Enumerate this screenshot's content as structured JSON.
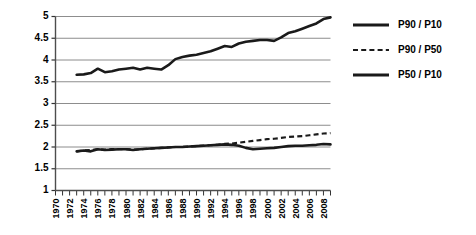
{
  "chart_data": {
    "type": "line",
    "title": "",
    "xlabel": "",
    "ylabel": "",
    "xlim": [
      1970,
      2009
    ],
    "ylim": [
      1,
      5
    ],
    "ygrid": true,
    "xgrid": false,
    "ytick_values": [
      1,
      1.5,
      2,
      2.5,
      3,
      3.5,
      4,
      4.5,
      5
    ],
    "ytick_labels": [
      "1",
      "1.5",
      "2",
      "2.5",
      "3",
      "3.5",
      "4",
      "4.5",
      "5"
    ],
    "xtick_labels": [
      "1970",
      "1972",
      "1974",
      "1976",
      "1978",
      "1980",
      "1982",
      "1984",
      "1986",
      "1988",
      "1990",
      "1992",
      "1994",
      "1996",
      "1998",
      "2000",
      "2002",
      "2004",
      "2006",
      "2008"
    ],
    "xtick_rotation": 90,
    "legend_position": "right",
    "x": [
      1973,
      1974,
      1975,
      1976,
      1977,
      1978,
      1979,
      1980,
      1981,
      1982,
      1983,
      1984,
      1985,
      1986,
      1987,
      1988,
      1989,
      1990,
      1991,
      1992,
      1993,
      1994,
      1995,
      1996,
      1997,
      1998,
      1999,
      2000,
      2001,
      2002,
      2003,
      2004,
      2005,
      2006,
      2007,
      2008,
      2009
    ],
    "series": [
      {
        "name": "P90 / P10",
        "style": "solid",
        "width": 2.6,
        "color": "#1a1a1a",
        "values": [
          3.66,
          3.67,
          3.7,
          3.8,
          3.72,
          3.74,
          3.78,
          3.8,
          3.82,
          3.78,
          3.82,
          3.8,
          3.78,
          3.88,
          4.02,
          4.07,
          4.1,
          4.12,
          4.16,
          4.2,
          4.26,
          4.32,
          4.3,
          4.38,
          4.42,
          4.44,
          4.46,
          4.46,
          4.44,
          4.52,
          4.62,
          4.66,
          4.72,
          4.78,
          4.84,
          4.94,
          4.98
        ]
      },
      {
        "name": "P90 / P50",
        "style": "dashed",
        "width": 2.2,
        "color": "#1a1a1a",
        "values": [
          1.9,
          1.92,
          1.93,
          1.95,
          1.94,
          1.95,
          1.95,
          1.95,
          1.94,
          1.95,
          1.96,
          1.97,
          1.98,
          1.99,
          2.0,
          2.0,
          2.01,
          2.02,
          2.03,
          2.04,
          2.05,
          2.07,
          2.08,
          2.1,
          2.12,
          2.14,
          2.16,
          2.18,
          2.19,
          2.21,
          2.23,
          2.24,
          2.25,
          2.27,
          2.29,
          2.31,
          2.32
        ]
      },
      {
        "name": "P50 / P10",
        "style": "solid",
        "width": 2.6,
        "color": "#1a1a1a",
        "values": [
          1.9,
          1.92,
          1.9,
          1.95,
          1.93,
          1.94,
          1.95,
          1.95,
          1.93,
          1.95,
          1.96,
          1.97,
          1.98,
          1.99,
          2.0,
          2.0,
          2.01,
          2.02,
          2.03,
          2.04,
          2.05,
          2.06,
          2.05,
          2.03,
          1.98,
          1.95,
          1.96,
          1.97,
          1.98,
          2.0,
          2.02,
          2.03,
          2.03,
          2.04,
          2.05,
          2.07,
          2.06
        ]
      }
    ]
  },
  "legend": {
    "items": [
      {
        "label": "P90 / P10",
        "style": "solid"
      },
      {
        "label": "P90 / P50",
        "style": "dashed"
      },
      {
        "label": "P50 / P10",
        "style": "solid"
      }
    ]
  },
  "colors": {
    "line": "#1a1a1a",
    "grid": "#808080",
    "axis": "#4d4d4d",
    "background": "#ffffff"
  }
}
